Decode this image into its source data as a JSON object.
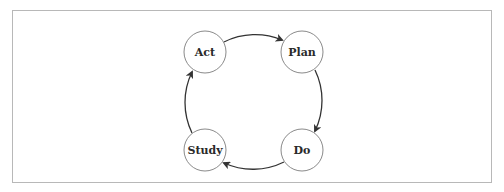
{
  "diagram": {
    "type": "cycle",
    "title": "",
    "nodes": [
      {
        "id": "plan",
        "label": "Plan",
        "cx": 302,
        "cy": 52
      },
      {
        "id": "do",
        "label": "Do",
        "cx": 302,
        "cy": 150
      },
      {
        "id": "study",
        "label": "Study",
        "cx": 205,
        "cy": 150
      },
      {
        "id": "act",
        "label": "Act",
        "cx": 205,
        "cy": 52
      }
    ],
    "edges": [
      {
        "from": "act",
        "to": "plan"
      },
      {
        "from": "plan",
        "to": "do"
      },
      {
        "from": "do",
        "to": "study"
      },
      {
        "from": "study",
        "to": "act"
      }
    ],
    "colors": {
      "frame_border": "#b8b8b8",
      "node_border": "#8a8a8a",
      "arrow": "#333333",
      "text": "#2a2a2a"
    }
  }
}
